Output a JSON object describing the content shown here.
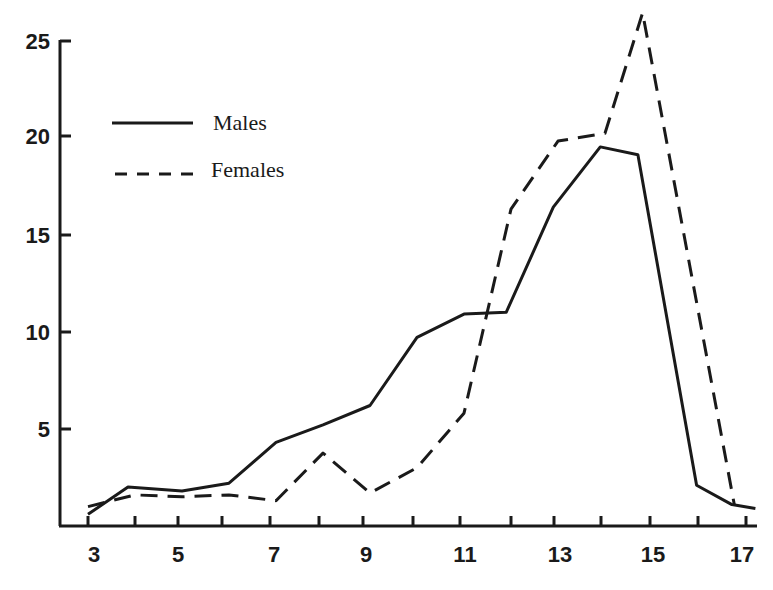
{
  "chart_data": {
    "type": "line",
    "title": "",
    "xlabel": "",
    "ylabel": "",
    "xlim": [
      3,
      17.25
    ],
    "ylim": [
      0,
      25
    ],
    "grid": false,
    "legend_position": "upper-left",
    "x_ticks": [
      3,
      4,
      5,
      6,
      7,
      8,
      9,
      10,
      11,
      12,
      13,
      14,
      15,
      16,
      17
    ],
    "x_tick_labels": [
      "3",
      "5",
      "7",
      "9",
      "11",
      "13",
      "15",
      "17"
    ],
    "y_ticks": [
      5,
      10,
      15,
      20,
      25
    ],
    "y_tick_labels": [
      "5",
      "10",
      "15",
      "20",
      "25"
    ],
    "series": [
      {
        "name": "Males",
        "style": "solid",
        "x": [
          3,
          3.85,
          5,
          6,
          7,
          8,
          9,
          10,
          11,
          11.9,
          12.9,
          13.9,
          14.7,
          15.95,
          16.7,
          17.2
        ],
        "values": [
          0.6,
          2.0,
          1.8,
          2.2,
          4.3,
          5.2,
          6.2,
          9.7,
          10.9,
          11.0,
          16.4,
          19.5,
          19.1,
          2.1,
          1.1,
          0.9
        ]
      },
      {
        "name": "Females",
        "style": "dashed",
        "x": [
          3,
          4,
          5,
          6,
          7,
          8,
          9,
          10,
          11,
          12,
          13,
          14,
          14.8,
          16.75
        ],
        "values": [
          1.0,
          1.6,
          1.5,
          1.6,
          1.3,
          3.75,
          1.7,
          3.0,
          5.8,
          16.3,
          19.8,
          20.2,
          26.4,
          1.1
        ]
      }
    ]
  },
  "legend": {
    "males_label": "Males",
    "females_label": "Females"
  },
  "axis": {
    "y_labels": [
      "25",
      "20",
      "15",
      "10",
      "5"
    ],
    "x_labels": [
      "3",
      "5",
      "7",
      "9",
      "11",
      "13",
      "15",
      "17"
    ]
  }
}
